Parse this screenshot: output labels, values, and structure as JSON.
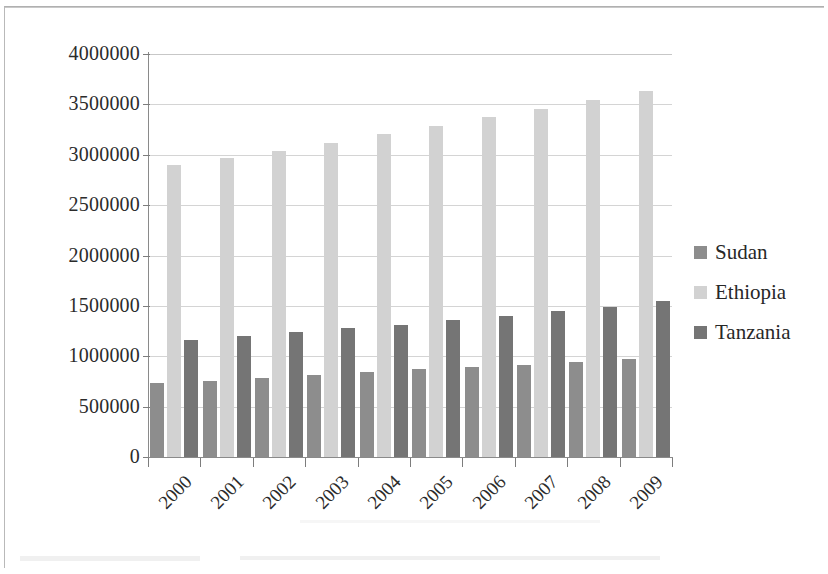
{
  "chart_data": {
    "type": "bar",
    "title": "",
    "subtitle": "",
    "xlabel": "",
    "ylabel": "",
    "categories": [
      "2000",
      "2001",
      "2002",
      "2003",
      "2004",
      "2005",
      "2006",
      "2007",
      "2008",
      "2009"
    ],
    "series": [
      {
        "name": "Sudan",
        "color": "#8d8d8d",
        "values": [
          730000,
          755000,
          780000,
          810000,
          840000,
          870000,
          895000,
          915000,
          940000,
          970000
        ]
      },
      {
        "name": "Ethiopia",
        "color": "#d2d2d2",
        "values": [
          2900000,
          2970000,
          3040000,
          3115000,
          3210000,
          3285000,
          3370000,
          3450000,
          3540000,
          3630000
        ]
      },
      {
        "name": "Tanzania",
        "color": "#757575",
        "values": [
          1165000,
          1205000,
          1240000,
          1280000,
          1315000,
          1360000,
          1400000,
          1445000,
          1490000,
          1545000
        ]
      }
    ],
    "ylim": [
      0,
      4000000
    ],
    "ytick_step": 500000,
    "ytick_labels": [
      "4000000",
      "3500000",
      "3000000",
      "2500000",
      "2000000",
      "1500000",
      "1000000",
      "500000",
      "0"
    ],
    "ytick_values": [
      4000000,
      3500000,
      3000000,
      2500000,
      2000000,
      1500000,
      1000000,
      500000,
      0
    ],
    "grid": true,
    "grid_axis": "y",
    "legend_position": "right",
    "legend_entries": [
      "Sudan",
      "Ethiopia",
      "Tanzania"
    ],
    "xtick_rotation": -45
  },
  "legend": {
    "items": [
      {
        "label": "Sudan",
        "color": "#8d8d8d"
      },
      {
        "label": "Ethiopia",
        "color": "#d2d2d2"
      },
      {
        "label": "Tanzania",
        "color": "#757575"
      }
    ]
  },
  "colors": {
    "sudan": "#8d8d8d",
    "ethiopia": "#d2d2d2",
    "tanzania": "#757575",
    "axis": "#8a8a8a",
    "grid": "#d4d4d4",
    "text": "#2b2b2b",
    "background": "#ffffff"
  }
}
